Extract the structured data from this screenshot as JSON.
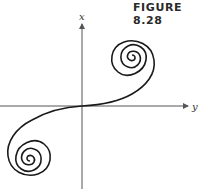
{
  "figure": {
    "title": "FIGURE 8.28",
    "axes": {
      "vertical_label": "x",
      "horizontal_label": "y"
    },
    "colors": {
      "curve": "#1a1a1a",
      "axes": "#555555"
    }
  }
}
